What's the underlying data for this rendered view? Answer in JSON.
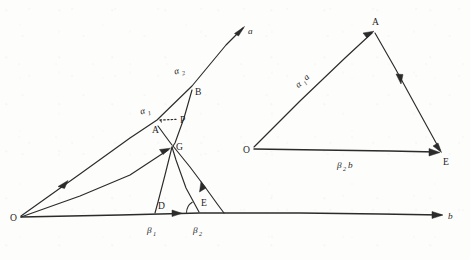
{
  "figure": {
    "ink_color": "#2b2b2b",
    "paper_color": "#fdfdfc",
    "left_diagram": {
      "name": "ray-construction",
      "rays": [
        {
          "id": "ray-a",
          "label": "a",
          "from": "O",
          "direction": "upper-right"
        },
        {
          "id": "ray-b",
          "label": "b",
          "from": "O",
          "direction": "right"
        }
      ],
      "points": [
        {
          "id": "O",
          "label": "O",
          "x": 20,
          "y": 217
        },
        {
          "id": "D",
          "label": "D",
          "x": 155,
          "y": 212
        },
        {
          "id": "E",
          "label": "E",
          "x": 200,
          "y": 212
        },
        {
          "id": "G",
          "label": "G",
          "x": 173,
          "y": 145
        },
        {
          "id": "A",
          "label": "A",
          "x": 157,
          "y": 127
        },
        {
          "id": "P",
          "label": "P",
          "x": 180,
          "y": 120
        },
        {
          "id": "B",
          "label": "B",
          "x": 192,
          "y": 88
        }
      ],
      "angle_labels": [
        {
          "id": "alpha-1",
          "greek": "α",
          "sub": "1",
          "x": 146,
          "y": 110,
          "near": "A"
        },
        {
          "id": "alpha-2",
          "greek": "α",
          "sub": "2",
          "x": 180,
          "y": 70,
          "near": "B"
        },
        {
          "id": "beta-1",
          "greek": "β",
          "sub": "1",
          "x": 150,
          "y": 235,
          "near": "D"
        },
        {
          "id": "beta-2",
          "greek": "β",
          "sub": "2",
          "x": 196,
          "y": 235,
          "near": "E"
        }
      ],
      "ray_labels": [
        {
          "id": "ray-label-a",
          "text": "a",
          "x": 249,
          "y": 33
        },
        {
          "id": "ray-label-b",
          "text": "b",
          "x": 450,
          "y": 218
        }
      ]
    },
    "right_diagram": {
      "name": "companion-triangle",
      "points": [
        {
          "id": "O2",
          "label": "O",
          "x": 252,
          "y": 147
        },
        {
          "id": "A2",
          "label": "A",
          "x": 376,
          "y": 20
        },
        {
          "id": "E2",
          "label": "E",
          "x": 447,
          "y": 153
        }
      ],
      "side_labels": [
        {
          "id": "side-OA",
          "greek": "α",
          "sub": "1",
          "letter": "a",
          "x": 303,
          "y": 80
        },
        {
          "id": "side-OE",
          "greek": "β",
          "sub": "2",
          "letter": "b",
          "x": 345,
          "y": 167
        }
      ]
    }
  }
}
